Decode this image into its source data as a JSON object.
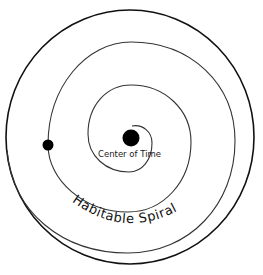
{
  "diagram": {
    "type": "spiral-orbit-diagram",
    "labels": {
      "center": "Center of Time",
      "spiral": "Habitable Spiral"
    },
    "elements": {
      "outer_circle": {
        "cx": 130,
        "cy": 137,
        "r": 123
      },
      "center_body": {
        "cx": 131,
        "cy": 138,
        "r": 8.5
      },
      "orbiting_body": {
        "cx": 48,
        "cy": 145,
        "r": 5.5
      }
    },
    "colors": {
      "line": "#1a1a1a",
      "background": "#ffffff",
      "fill": "#000000"
    }
  }
}
